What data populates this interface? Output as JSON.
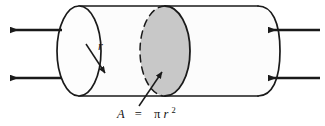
{
  "figure": {
    "canvas": {
      "width": 325,
      "height": 126
    },
    "background_color": "#ffffff",
    "stroke_color": "#1a1a1a",
    "body_fill": "#fcfcfc",
    "cross_section_fill": "#c8c8c8",
    "cross_section_stroke": "#1a1a1a"
  },
  "labels": {
    "radius": "r",
    "area_equation_lhs": "A",
    "area_equation_eq": "=",
    "area_equation_rhs_pi": "π",
    "area_equation_rhs_r": "r",
    "area_equation_rhs_exp": "2",
    "area_equation_full": "A = πr²"
  },
  "geometry": {
    "cylinder": {
      "top_line_y": 6,
      "bottom_line_y": 96,
      "left_end_center_x": 79,
      "left_end_rx": 22,
      "left_end_ry": 45,
      "right_end_x": 258,
      "right_end_rx": 22,
      "right_end_ry": 45
    },
    "cross_section": {
      "center_x": 165,
      "center_y": 51,
      "rx": 25,
      "ry": 45
    },
    "radius_arrow": {
      "from_x": 86,
      "from_y": 44,
      "to_x": 106,
      "to_y": 74
    },
    "label_leader": {
      "from_x": 140,
      "from_y": 104,
      "to_x": 163,
      "to_y": 73
    }
  },
  "arrows": {
    "left": [
      {
        "name": "left-arrow-upper",
        "y": 30,
        "tail_x": 62,
        "head_x": 8,
        "direction": "left"
      },
      {
        "name": "left-arrow-lower",
        "y": 78,
        "tail_x": 62,
        "head_x": 8,
        "direction": "left"
      }
    ],
    "right": [
      {
        "name": "right-arrow-upper",
        "y": 30,
        "tail_x": 318,
        "head_x": 266,
        "direction": "left"
      },
      {
        "name": "right-arrow-lower",
        "y": 78,
        "tail_x": 318,
        "head_x": 266,
        "direction": "left"
      }
    ]
  }
}
